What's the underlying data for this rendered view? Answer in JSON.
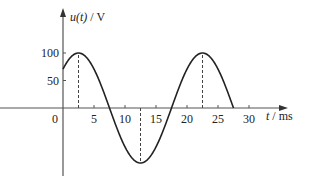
{
  "chart_data": {
    "type": "line",
    "title": "",
    "xlabel": "t / ms",
    "ylabel": "u(t) / V",
    "xlabel_var": "t",
    "xlabel_unit": " / ms",
    "ylabel_var": "u(t)",
    "ylabel_unit": " / V",
    "x_ticks": [
      5,
      10,
      15,
      20,
      25,
      30
    ],
    "y_ticks": [
      50,
      100
    ],
    "origin_label": "0",
    "xlim": [
      0,
      30
    ],
    "ylim": [
      -100,
      100
    ],
    "grid": false,
    "legend": null,
    "series": [
      {
        "name": "u(t)",
        "amplitude": 100,
        "period_ms": 20,
        "formula": "100*cos(2*pi*(t-2.5)/20)",
        "x": [
          0,
          2.5,
          5,
          7.5,
          10,
          12.5,
          15,
          17.5,
          20,
          22.5,
          25,
          27.5
        ],
        "values": [
          70.7,
          100,
          70.7,
          0,
          -70.7,
          -100,
          -70.7,
          0,
          70.7,
          100,
          70.7,
          0
        ]
      }
    ],
    "annotations": [
      {
        "type": "dashed-vline",
        "x": 2.5,
        "from": 0,
        "to": 100
      },
      {
        "type": "dashed-vline",
        "x": 12.5,
        "from": 0,
        "to": -100
      },
      {
        "type": "dashed-vline",
        "x": 22.5,
        "from": 0,
        "to": 100
      }
    ]
  }
}
